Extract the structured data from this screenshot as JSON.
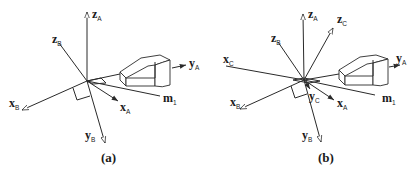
{
  "figure": {
    "panels": [
      {
        "caption": "(a)",
        "axes": [
          {
            "base": "z",
            "sub": "A"
          },
          {
            "base": "z",
            "sub": "B"
          },
          {
            "base": "x",
            "sub": "B"
          },
          {
            "base": "y",
            "sub": "B"
          },
          {
            "base": "x",
            "sub": "A"
          },
          {
            "base": "m",
            "sub": "1"
          },
          {
            "base": "y",
            "sub": "A"
          }
        ]
      },
      {
        "caption": "(b)",
        "axes": [
          {
            "base": "z",
            "sub": "A"
          },
          {
            "base": "z",
            "sub": "C"
          },
          {
            "base": "z",
            "sub": "B"
          },
          {
            "base": "x",
            "sub": "C"
          },
          {
            "base": "x",
            "sub": "B"
          },
          {
            "base": "y",
            "sub": "C"
          },
          {
            "base": "x",
            "sub": "A"
          },
          {
            "base": "m",
            "sub": "1"
          },
          {
            "base": "y",
            "sub": "B"
          },
          {
            "base": "y",
            "sub": "A"
          }
        ]
      }
    ],
    "line_color": "#2a2a2a",
    "background": "#ffffff"
  }
}
